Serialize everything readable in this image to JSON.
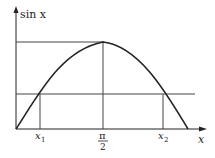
{
  "figure": {
    "y_axis_label": "sin x",
    "x_axis_label": "x",
    "tick_labels": {
      "x1": "x",
      "x1_sub": "1",
      "pi_num": "π",
      "pi_den": "2",
      "x2": "x",
      "x2_sub": "2"
    },
    "colors": {
      "stroke": "#222222",
      "background": "#ffffff"
    }
  }
}
